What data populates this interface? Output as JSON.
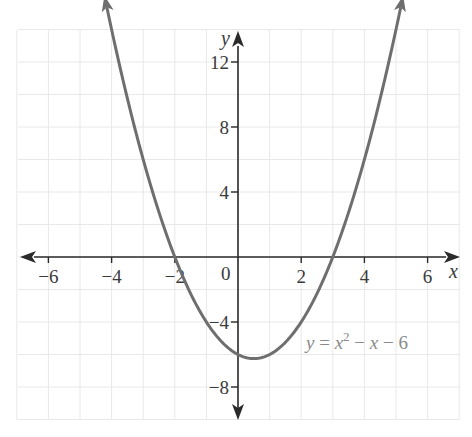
{
  "chart_data": {
    "type": "line",
    "title": "",
    "xlabel": "x",
    "ylabel": "y",
    "xlim": [
      -7,
      7
    ],
    "ylim": [
      -10,
      14
    ],
    "x_ticks": [
      -6,
      -4,
      -2,
      2,
      4,
      6
    ],
    "y_ticks": [
      12,
      8,
      4,
      -4,
      -8
    ],
    "x_tick_labels": [
      "−6",
      "−4",
      "−2",
      "2",
      "4",
      "6"
    ],
    "y_tick_labels": [
      "12",
      "8",
      "4",
      "−4",
      "−8"
    ],
    "origin_label": "0",
    "grid": true,
    "grid_x_step": 1,
    "grid_y_step": 2,
    "series": [
      {
        "name": "y = x² − x − 6",
        "function": "x^2 - x - 6",
        "x": [
          -4.2,
          -4,
          -3,
          -2,
          -1,
          0,
          0.5,
          1,
          2,
          3,
          4,
          5,
          5.2
        ],
        "values": [
          15.84,
          14,
          6,
          0,
          -4,
          -6,
          -6.25,
          -6,
          -4,
          0,
          6,
          14,
          15.84
        ],
        "color": "#6e6e6e",
        "arrows_at_ends": true
      }
    ],
    "annotations": [
      {
        "text": "y = x² − x − 6",
        "x": 4,
        "y": -5.5
      }
    ],
    "key_points": {
      "x_intercepts": [
        -2,
        3
      ],
      "y_intercept": -6,
      "vertex": [
        0.5,
        -6.25
      ]
    }
  },
  "labels": {
    "x_axis": "x",
    "y_axis": "y",
    "origin": "0",
    "ticks_x": [
      "−6",
      "−4",
      "−2",
      "2",
      "4",
      "6"
    ],
    "ticks_y": [
      "12",
      "8",
      "4",
      "−4",
      "−8"
    ],
    "equation": {
      "lhs": "y",
      "eq": " = ",
      "base": "x",
      "exp": "2",
      "rest1": " − ",
      "x2": "x",
      "rest2": " − 6"
    }
  },
  "colors": {
    "curve": "#6e6e6e",
    "axis": "#2a2a2a",
    "grid": "#e6e6e6",
    "equation_text": "#8a8a8a"
  }
}
